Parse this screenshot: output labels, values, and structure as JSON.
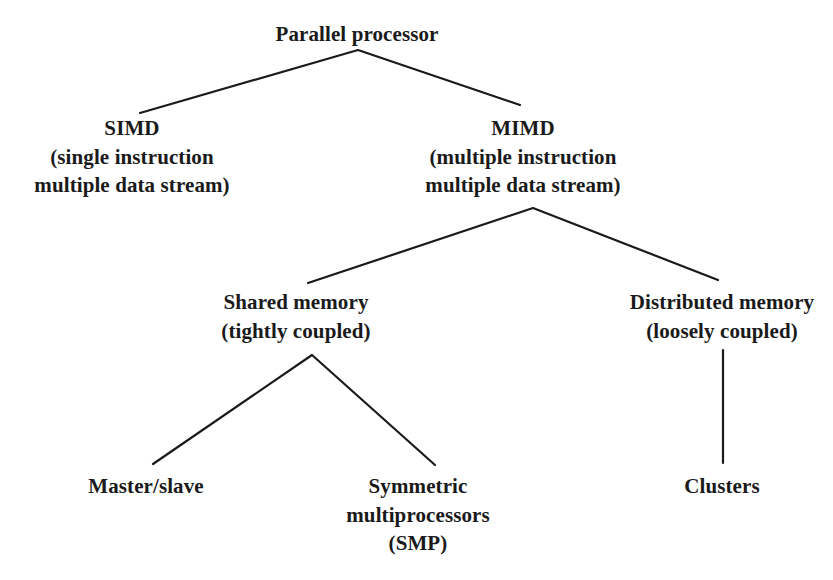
{
  "diagram": {
    "line_color": "#1a1a1a",
    "text_color": "#1a1a1a",
    "nodes": {
      "root": {
        "lines": [
          "Parallel processor"
        ]
      },
      "simd": {
        "lines": [
          "SIMD",
          "(single instruction",
          "multiple data stream)"
        ]
      },
      "mimd": {
        "lines": [
          "MIMD",
          "(multiple instruction",
          "multiple data stream)"
        ]
      },
      "shared": {
        "lines": [
          "Shared memory",
          "(tightly coupled)"
        ]
      },
      "distributed": {
        "lines": [
          "Distributed memory",
          "(loosely coupled)"
        ]
      },
      "master_slave": {
        "lines": [
          "Master/slave"
        ]
      },
      "smp": {
        "lines": [
          "Symmetric",
          "multiprocessors",
          "(SMP)"
        ]
      },
      "clusters": {
        "lines": [
          "Clusters"
        ]
      }
    },
    "edges": [
      {
        "from": "root",
        "to": "simd"
      },
      {
        "from": "root",
        "to": "mimd"
      },
      {
        "from": "mimd",
        "to": "shared"
      },
      {
        "from": "mimd",
        "to": "distributed"
      },
      {
        "from": "shared",
        "to": "master_slave"
      },
      {
        "from": "shared",
        "to": "smp"
      },
      {
        "from": "distributed",
        "to": "clusters"
      }
    ]
  }
}
